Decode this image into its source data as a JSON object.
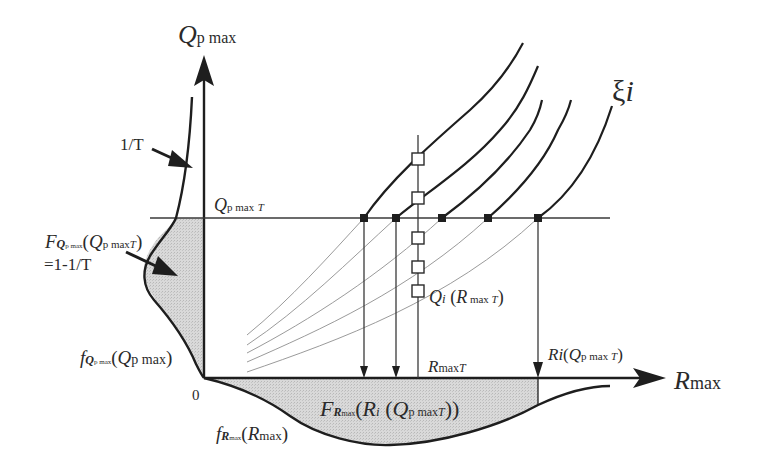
{
  "diagram": {
    "axes": {
      "y_axis": {
        "symbol": "Q",
        "subscript": "p max"
      },
      "x_axis": {
        "symbol": "R",
        "subscript": "max"
      },
      "origin": "0"
    },
    "threshold": {
      "symbol": "Q",
      "subscript": "p max",
      "subscript_T": "T"
    },
    "curve_family_label": {
      "symbol": "ξ",
      "index": "i"
    },
    "return_period_annotation": "1/T",
    "cdf_q_annotation": {
      "F": "F",
      "F_sub": "Q",
      "F_subsub": "p max",
      "arg_open": "(",
      "arg_symbol": "Q",
      "arg_sub": "p max",
      "arg_subT": "T",
      "arg_close": ")",
      "equals": "=1-1/T"
    },
    "pdf_q_label": {
      "f": "f",
      "f_sub": "Q",
      "f_subsub": "p max",
      "arg_open": "(",
      "arg_symbol": "Q",
      "arg_sub": "p max",
      "arg_close": ")"
    },
    "pdf_r_label": {
      "f": "f",
      "f_sub": "R",
      "f_subsub": "max",
      "arg_open": "(",
      "arg_symbol": "R",
      "arg_sub": "max",
      "arg_close": ")"
    },
    "cdf_r_label": {
      "F": "F",
      "F_sub": "R",
      "F_subsub": "max",
      "arg_open": "(",
      "arg_symbol": "R",
      "arg_sub": "i",
      "arg_open2": " (",
      "arg2_symbol": "Q",
      "arg2_sub": "p max",
      "arg2_subT": "T",
      "arg_close": "))"
    },
    "rmax_T_label": {
      "symbol": "R",
      "sub": "max",
      "subT": "T"
    },
    "qi_label": {
      "symbol": "Q",
      "sub": "i",
      "arg_open": " (",
      "arg_symbol": "R",
      "arg_sub": " max ",
      "arg_subT": "T",
      "arg_close": ")"
    },
    "ri_label": {
      "symbol": "Ri",
      "arg_open": "(",
      "arg_symbol": "Q",
      "arg_sub": "p max ",
      "arg_subT": "T",
      "arg_close": ")"
    },
    "filled_markers_x": [
      364,
      396,
      442,
      488,
      538
    ],
    "open_markers_y": [
      159,
      198,
      238,
      267,
      291
    ],
    "down_arrows_x": [
      364,
      396,
      538
    ],
    "colors": {
      "ink": "#1e1e1e",
      "thin": "#8a8a8a",
      "fill": "#d4d4d4"
    }
  }
}
